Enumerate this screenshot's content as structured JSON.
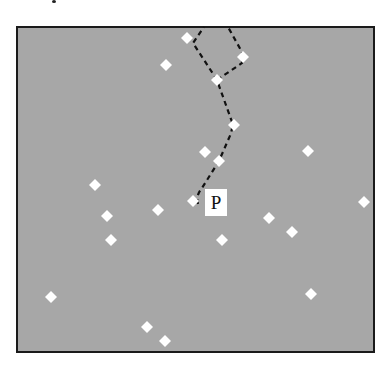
{
  "diagram": {
    "title": "",
    "frame": {
      "x": 17,
      "y": 27,
      "width": 357,
      "height": 325
    },
    "colors": {
      "field": "#a7a7a7",
      "frame_border": "#1a1a1a",
      "point": "#ffffff",
      "path": "#111111",
      "label_bg": "#ffffff",
      "label_text": "#111111"
    },
    "point_label": {
      "text": "P",
      "box": {
        "x": 205,
        "y": 189,
        "width": 22,
        "height": 27
      },
      "anchor_point_index": 9
    },
    "points": [
      {
        "x": 187,
        "y": 38
      },
      {
        "x": 243,
        "y": 57
      },
      {
        "x": 166,
        "y": 65
      },
      {
        "x": 217,
        "y": 80
      },
      {
        "x": 234,
        "y": 125
      },
      {
        "x": 205,
        "y": 152
      },
      {
        "x": 308,
        "y": 151
      },
      {
        "x": 219,
        "y": 161
      },
      {
        "x": 95,
        "y": 185
      },
      {
        "x": 193,
        "y": 201
      },
      {
        "x": 364,
        "y": 202
      },
      {
        "x": 158,
        "y": 210
      },
      {
        "x": 107,
        "y": 216
      },
      {
        "x": 269,
        "y": 218
      },
      {
        "x": 292,
        "y": 232
      },
      {
        "x": 111,
        "y": 240
      },
      {
        "x": 222,
        "y": 240
      },
      {
        "x": 51,
        "y": 297
      },
      {
        "x": 311,
        "y": 294
      },
      {
        "x": 147,
        "y": 327
      },
      {
        "x": 165,
        "y": 341
      }
    ],
    "paths": [
      {
        "name": "main-path-from-p",
        "style": "dashed",
        "d": "M 198 204 C 196 198, 198 193, 202 188 L 219 161 L 229 138 Q 233 130 232 122 L 217 80 L 193 43 L 204 27"
      },
      {
        "name": "branch-path-right",
        "style": "dashed",
        "d": "M 217 80 L 242 63 L 242 52 L 228 27"
      }
    ]
  }
}
